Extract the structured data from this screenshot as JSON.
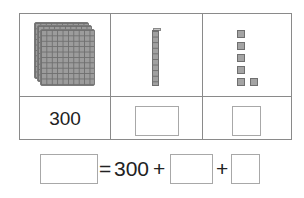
{
  "table": {
    "columns": [
      {
        "name": "hundreds",
        "model": "3 hundred-flats",
        "count": 3,
        "value": "300"
      },
      {
        "name": "tens",
        "model": "1 ten-rod",
        "count": 1,
        "value": ""
      },
      {
        "name": "ones",
        "model": "6 unit cubes",
        "count": 6,
        "value": ""
      }
    ]
  },
  "equation": {
    "equals": "=",
    "first_addend": "300",
    "plus": "+",
    "answer_box": "",
    "tens_box": "",
    "ones_box": ""
  },
  "colors": {
    "border": "#8a8a8a",
    "block": "#9c9c9c",
    "text": "#222222"
  }
}
